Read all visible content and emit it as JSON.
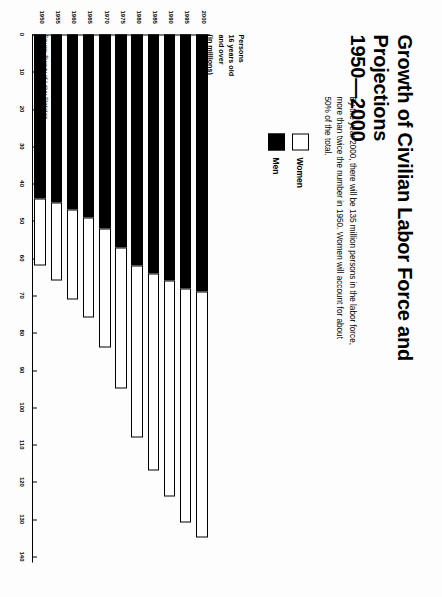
{
  "title": {
    "line1": "Growth of Civilian Labor Force and Projections",
    "line2": "1950—2000"
  },
  "subtitle": "By the year 2000, there will be 135 million persons in the labor force, more than twice the number in 1950.  Women will account for about 50% of the total.",
  "legend": {
    "women_label": "Women",
    "men_label": "Men",
    "women_color": "#ffffff",
    "men_color": "#000000"
  },
  "y_axis_caption": "Persons\n16 years old\nand over\n(in millions)",
  "y_axis_caption_lines": {
    "l1": "Persons",
    "l2": "16 years old",
    "l3": "and over",
    "l4": "(in millions)"
  },
  "source": "Source: Bureau of Labor Statistics,\nPM U.S.A. Economist",
  "source_lines": {
    "l1": "Source: Bureau of Labor Statistics,",
    "l2": "PM U.S.A. Economist"
  },
  "chart_data": {
    "type": "bar",
    "orientation": "horizontal-stacked",
    "title": "Growth of Civilian Labor Force and Projections 1950—2000",
    "xlabel": "",
    "ylabel": "Persons 16 years old and over (in millions)",
    "ylim": [
      0,
      140
    ],
    "grid": false,
    "legend_position": "upper-left",
    "tick_values": [
      0,
      10,
      20,
      30,
      40,
      50,
      60,
      70,
      80,
      90,
      100,
      110,
      120,
      130,
      140
    ],
    "tick_labels": [
      "0",
      "10",
      "20",
      "30",
      "40",
      "50",
      "60",
      "70",
      "80",
      "90",
      "100",
      "110",
      "120",
      "130",
      "140"
    ],
    "categories": [
      "1950",
      "1955",
      "1960",
      "1965",
      "1970",
      "1975",
      "1980",
      "1985",
      "1990",
      "1995",
      "2000"
    ],
    "series": [
      {
        "name": "Men",
        "color": "#000000",
        "values": [
          44,
          45,
          47,
          49,
          52,
          57,
          62,
          64,
          66,
          68,
          69
        ]
      },
      {
        "name": "Women",
        "color": "#ffffff",
        "values": [
          18,
          21,
          24,
          27,
          32,
          38,
          46,
          53,
          58,
          63,
          66
        ]
      }
    ],
    "totals": [
      62,
      66,
      71,
      76,
      84,
      95,
      108,
      117,
      124,
      131,
      135
    ]
  }
}
